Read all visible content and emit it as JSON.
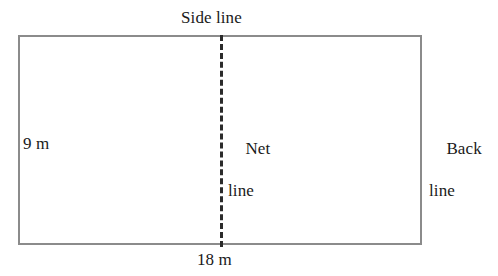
{
  "figure": {
    "background_color": "#ffffff",
    "border_color": "#8b8b8b",
    "net_line_color": "#2b2b2b",
    "text_color": "#1a1a1a"
  },
  "court": {
    "shape": "rectangle",
    "width_label": "18 m",
    "height_label": "9 m",
    "net_line_style": "dashed-vertical-center"
  },
  "labels": {
    "side_line": "Side line",
    "net_line_word1": "Net",
    "net_line_word2": "line",
    "back_line_word1": "Back",
    "back_line_word2": "line",
    "height": "9 m",
    "width": "18 m"
  },
  "chart_data": {
    "type": "diagram",
    "elements": [
      {
        "name": "court-rectangle",
        "label": "playing court",
        "width_m": 18,
        "height_m": 9
      },
      {
        "name": "net-line",
        "label": "Net line",
        "position": "vertical center of court",
        "style": "dashed"
      },
      {
        "name": "side-line",
        "label": "Side line",
        "position": "top edge of court"
      },
      {
        "name": "back-line",
        "label": "Back line",
        "position": "right edge of court"
      }
    ],
    "dimensions": [
      {
        "name": "length",
        "value": 18,
        "unit": "m",
        "label": "18 m",
        "position": "bottom"
      },
      {
        "name": "width",
        "value": 9,
        "unit": "m",
        "label": "9 m",
        "position": "left"
      }
    ]
  }
}
